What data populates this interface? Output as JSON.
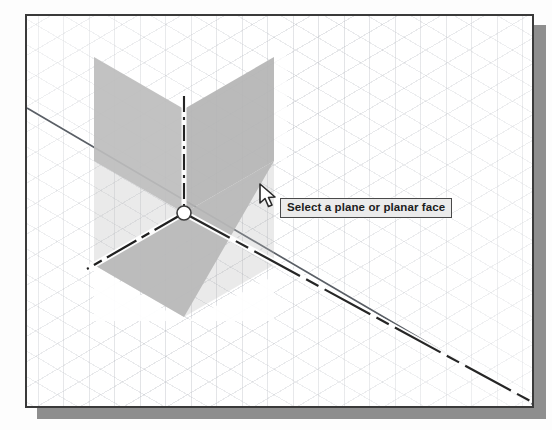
{
  "app": {
    "view_kind": "isometric-cad-viewport",
    "background_color": "#ffffff",
    "frame_border_color": "#3a3a3a",
    "shadow_color": "#8e8e8e"
  },
  "viewport": {
    "grid": {
      "visible": true,
      "style": "isometric",
      "line_color": "#969ba5"
    },
    "construction_line": {
      "name": "long-diagonal-construction-line",
      "color": "#555a60",
      "from": [
        0,
        92
      ],
      "to": [
        505,
        388
      ]
    }
  },
  "origin_widget": {
    "name": "origin-planes-triad",
    "center": [
      157,
      197
    ],
    "plane_fill": "#b8b8b8",
    "plane_fill_light": "#c4c4c4",
    "axis_color": "#2b2b2b",
    "axis_halo_color": "#ffffff",
    "origin_marker_color": "#ffffff",
    "planes": [
      {
        "label": "top-plane",
        "name": "origin-plane-top"
      },
      {
        "label": "right-plane",
        "name": "origin-plane-right"
      },
      {
        "label": "front-plane",
        "name": "origin-plane-front"
      }
    ],
    "axes": [
      {
        "label": "vertical-axis",
        "name": "axis-vertical"
      },
      {
        "label": "left-axis",
        "name": "axis-left"
      },
      {
        "label": "right-axis",
        "name": "axis-right"
      }
    ]
  },
  "cursor": {
    "name": "mouse-pointer",
    "shape": "arrow",
    "position": [
      232,
      167
    ],
    "fill": "#ffffff",
    "stroke": "#2a2a2a"
  },
  "tooltip": {
    "text": "Select a plane or planar face",
    "background": "#ebebeb",
    "border": "#4a4a4a",
    "text_color": "#1c1c1c",
    "position": [
      253,
      182
    ]
  }
}
